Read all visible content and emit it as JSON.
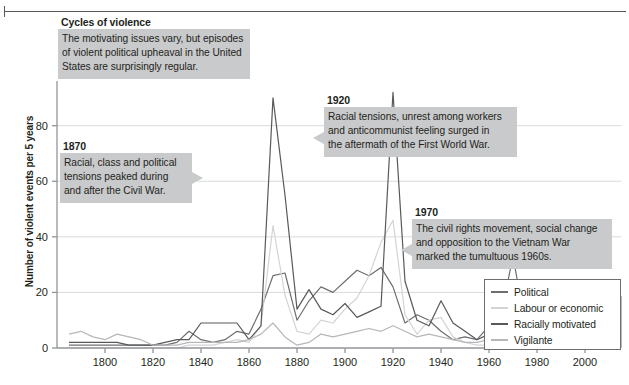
{
  "chart_data": {
    "type": "line",
    "title": "Cycles of violence",
    "subtitle": "The motivating issues vary, but episodes\nof violent political upheaval in the United\nStates are surprisingly regular.",
    "xlabel": "",
    "ylabel": "Number of violent events per 5 years",
    "xlim": [
      1780,
      2015
    ],
    "ylim": [
      0,
      95
    ],
    "xticks": [
      1800,
      1820,
      1840,
      1860,
      1880,
      1900,
      1920,
      1940,
      1960,
      1980,
      2000
    ],
    "yticks": [
      0,
      20,
      40,
      60,
      80
    ],
    "grid": "horizontal",
    "legend_position": "bottom-right",
    "x": [
      1785,
      1790,
      1795,
      1800,
      1805,
      1810,
      1815,
      1820,
      1825,
      1830,
      1835,
      1840,
      1845,
      1850,
      1855,
      1860,
      1865,
      1870,
      1875,
      1880,
      1885,
      1890,
      1895,
      1900,
      1905,
      1910,
      1915,
      1920,
      1925,
      1930,
      1935,
      1940,
      1945,
      1950,
      1955,
      1960,
      1965,
      1970,
      1975,
      1980,
      1985,
      1990,
      1995,
      2000,
      2005,
      2010
    ],
    "series": [
      {
        "name": "Political",
        "color": "#6d6e71",
        "values": [
          1,
          1,
          1,
          1,
          1,
          1,
          1,
          1,
          1,
          2,
          6,
          3,
          2,
          3,
          6,
          5,
          14,
          26,
          27,
          10,
          17,
          22,
          20,
          24,
          28,
          26,
          29,
          22,
          9,
          12,
          10,
          6,
          3,
          4,
          3,
          8,
          12,
          33,
          9,
          6,
          7,
          10,
          9,
          7,
          9,
          12
        ]
      },
      {
        "name": "Labour or economic",
        "color": "#d3d4d5",
        "values": [
          0,
          0,
          0,
          0,
          0,
          0,
          0,
          0,
          0,
          0,
          1,
          1,
          1,
          2,
          3,
          2,
          8,
          44,
          19,
          6,
          5,
          10,
          9,
          14,
          18,
          26,
          38,
          46,
          12,
          5,
          10,
          11,
          4,
          2,
          1,
          1,
          2,
          2,
          3,
          7,
          6,
          5,
          6,
          5,
          6,
          9
        ]
      },
      {
        "name": "Racially motivated",
        "color": "#58595b",
        "values": [
          2,
          2,
          2,
          2,
          2,
          1,
          1,
          1,
          2,
          3,
          3,
          9,
          9,
          9,
          9,
          3,
          8,
          90,
          55,
          14,
          21,
          14,
          12,
          16,
          11,
          13,
          15,
          92,
          24,
          10,
          8,
          17,
          9,
          6,
          3,
          5,
          6,
          4,
          3,
          2,
          1,
          1,
          1,
          1,
          1,
          1
        ]
      },
      {
        "name": "Vigilante",
        "color": "#b6b7b9",
        "values": [
          5,
          6,
          4,
          3,
          5,
          4,
          3,
          1,
          1,
          1,
          2,
          2,
          2,
          2,
          2,
          3,
          5,
          9,
          4,
          1,
          2,
          5,
          4,
          5,
          6,
          7,
          6,
          8,
          6,
          4,
          5,
          4,
          3,
          2,
          2,
          3,
          5,
          7,
          5,
          9,
          7,
          9,
          11,
          8,
          13,
          6
        ]
      }
    ],
    "annotations": [
      {
        "id": "anno-1870",
        "title": "1870",
        "text": "Racial, class and political\ntensions peaked during\nand after the Civil War.",
        "tail": "right"
      },
      {
        "id": "anno-1920",
        "title": "1920",
        "text": "Racial tensions, unrest among workers\nand anticommunist feeling surged in\nthe aftermath of the First World War.",
        "tail": "left"
      },
      {
        "id": "anno-1970",
        "title": "1970",
        "text": "The civil rights movement, social change\nand opposition to the Vietnam War\nmarked the tumultuous 1960s.",
        "tail": "left"
      }
    ]
  },
  "colors": {
    "annotation_background": "#c9cacb",
    "axis": "#939598",
    "grid": "#d9dadb",
    "text": "#231f20",
    "rule": "#58595b"
  }
}
